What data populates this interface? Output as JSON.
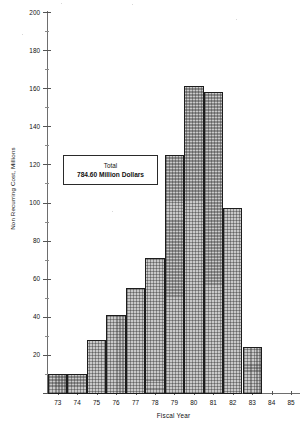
{
  "chart_data": {
    "type": "bar",
    "title": "",
    "xlabel": "Fiscal Year",
    "ylabel": "Non Recurring Cost, Millions",
    "categories": [
      "73",
      "74",
      "75",
      "76",
      "77",
      "78",
      "79",
      "80",
      "81",
      "82",
      "83",
      "84",
      "85"
    ],
    "values": [
      10,
      10,
      28,
      41,
      55,
      71,
      125,
      161,
      158,
      97,
      24,
      0,
      0
    ],
    "ylim": [
      0,
      200
    ],
    "yticks": [
      0,
      20,
      40,
      60,
      80,
      100,
      120,
      140,
      160,
      180,
      200
    ],
    "ytick_labels": [
      "",
      "20",
      "40",
      "60",
      "80",
      "100",
      "120",
      "140",
      "160",
      "180",
      "200"
    ],
    "xlim": [
      "73",
      "85"
    ],
    "grid": false,
    "legend": false,
    "bar_fill": "#c9c9c9",
    "bar_edge": "#1d1d1d",
    "annotations": [
      {
        "name": "total-box",
        "line1": "Total",
        "line2": "784.60 Million Dollars"
      }
    ]
  }
}
